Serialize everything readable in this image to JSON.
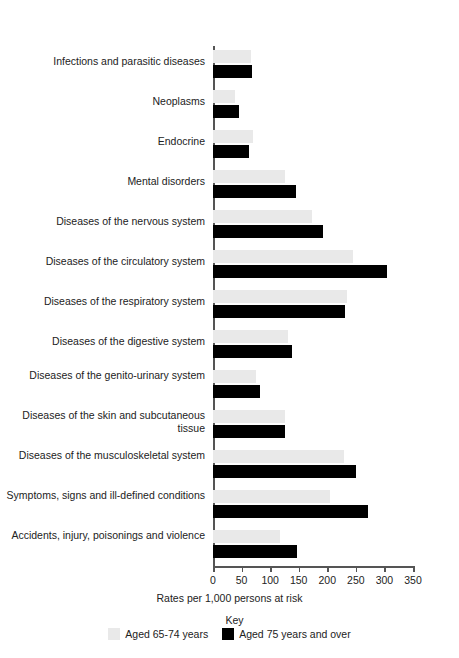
{
  "chart_data": {
    "type": "bar",
    "orientation": "horizontal",
    "title": "",
    "xlabel": "Rates per 1,000 persons at risk",
    "ylabel": "",
    "xlim": [
      0,
      350
    ],
    "xticks": [
      0,
      50,
      100,
      150,
      200,
      250,
      300,
      350
    ],
    "grid": false,
    "legend_position": "bottom",
    "legend_title": "Key",
    "categories": [
      "Infections and parasitic diseases",
      "Neoplasms",
      "Endocrine",
      "Mental disorders",
      "Diseases of the nervous system",
      "Diseases of the circulatory system",
      "Diseases of the respiratory system",
      "Diseases of the digestive system",
      "Diseases of the genito-urinary system",
      "Diseases of the skin and subcutaneous tissue",
      "Diseases of the musculoskeletal system",
      "Symptoms, signs and ill-defined conditions",
      "Accidents, injury, poisonings and violence"
    ],
    "series": [
      {
        "name": "Aged 65-74 years",
        "color": "#e9e9e9",
        "values": [
          66,
          38,
          70,
          126,
          173,
          245,
          234,
          131,
          75,
          126,
          230,
          204,
          117
        ]
      },
      {
        "name": "Aged 75 years and over",
        "color": "#000000",
        "values": [
          68,
          46,
          63,
          145,
          192,
          305,
          231,
          138,
          82,
          126,
          251,
          272,
          147
        ]
      }
    ]
  },
  "colors": {
    "light_bar": "#e9e9e9",
    "dark_bar": "#000000",
    "axis": "#555555",
    "text": "#222222",
    "background": "#ffffff"
  }
}
